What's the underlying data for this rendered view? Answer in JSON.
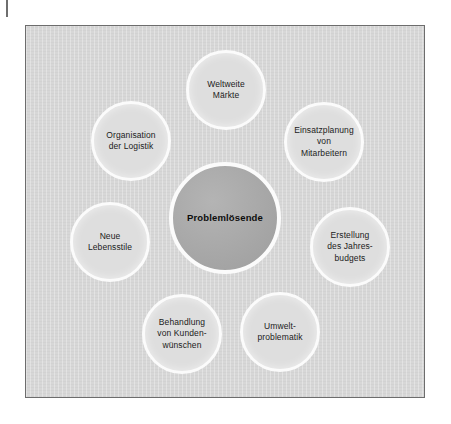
{
  "page": {
    "background_color": "#ffffff",
    "crop_tick_color": "#6e6e6e"
  },
  "panel": {
    "background_color": "#d7d7d7",
    "border_color": "#6d6d6d"
  },
  "diagram": {
    "type": "radial-cluster",
    "center": {
      "label": "Problemlösende",
      "fill_color": "#a9a9a9",
      "ring_color": "#fbfbfb",
      "x": 225,
      "y": 218,
      "diameter": 112
    },
    "satellite_fill_color": "#dedede",
    "satellite_ring_color": "#fbfbfb",
    "satellites": [
      {
        "id": "weltweite-maerkte",
        "label": "Weltweite\nMärkte",
        "lines": [
          "Weltweite",
          "Märkte"
        ],
        "x": 226,
        "y": 90,
        "diameter": 80
      },
      {
        "id": "einsatzplanung-von-mitarbeitern",
        "label": "Einsatzplanung\nvon\nMitarbeitern",
        "lines": [
          "Einsatzplanung",
          "von",
          "Mitarbeitern"
        ],
        "x": 324,
        "y": 142,
        "diameter": 80
      },
      {
        "id": "erstellung-des-jahresbudgets",
        "label": "Erstellung\ndes Jahres-\nbudgets",
        "lines": [
          "Erstellung",
          "des Jahres-",
          "budgets"
        ],
        "x": 350,
        "y": 247,
        "diameter": 80
      },
      {
        "id": "umweltproblematik",
        "label": "Umwelt-\nproblematik",
        "lines": [
          "Umwelt-",
          "problematik"
        ],
        "x": 280,
        "y": 332,
        "diameter": 80
      },
      {
        "id": "behandlung-von-kundenwuenschen",
        "label": "Behandlung\nvon Kunden-\nwünschen",
        "lines": [
          "Behandlung",
          "von Kunden-",
          "wünschen"
        ],
        "x": 182,
        "y": 334,
        "diameter": 80
      },
      {
        "id": "neue-lebensstile",
        "label": "Neue\nLebensstile",
        "lines": [
          "Neue",
          "Lebensstile"
        ],
        "x": 110,
        "y": 242,
        "diameter": 80
      },
      {
        "id": "organisation-der-logistik",
        "label": "Organisation\nder Logistik",
        "lines": [
          "Organisation",
          "der Logistik"
        ],
        "x": 131,
        "y": 141,
        "diameter": 80
      }
    ]
  }
}
